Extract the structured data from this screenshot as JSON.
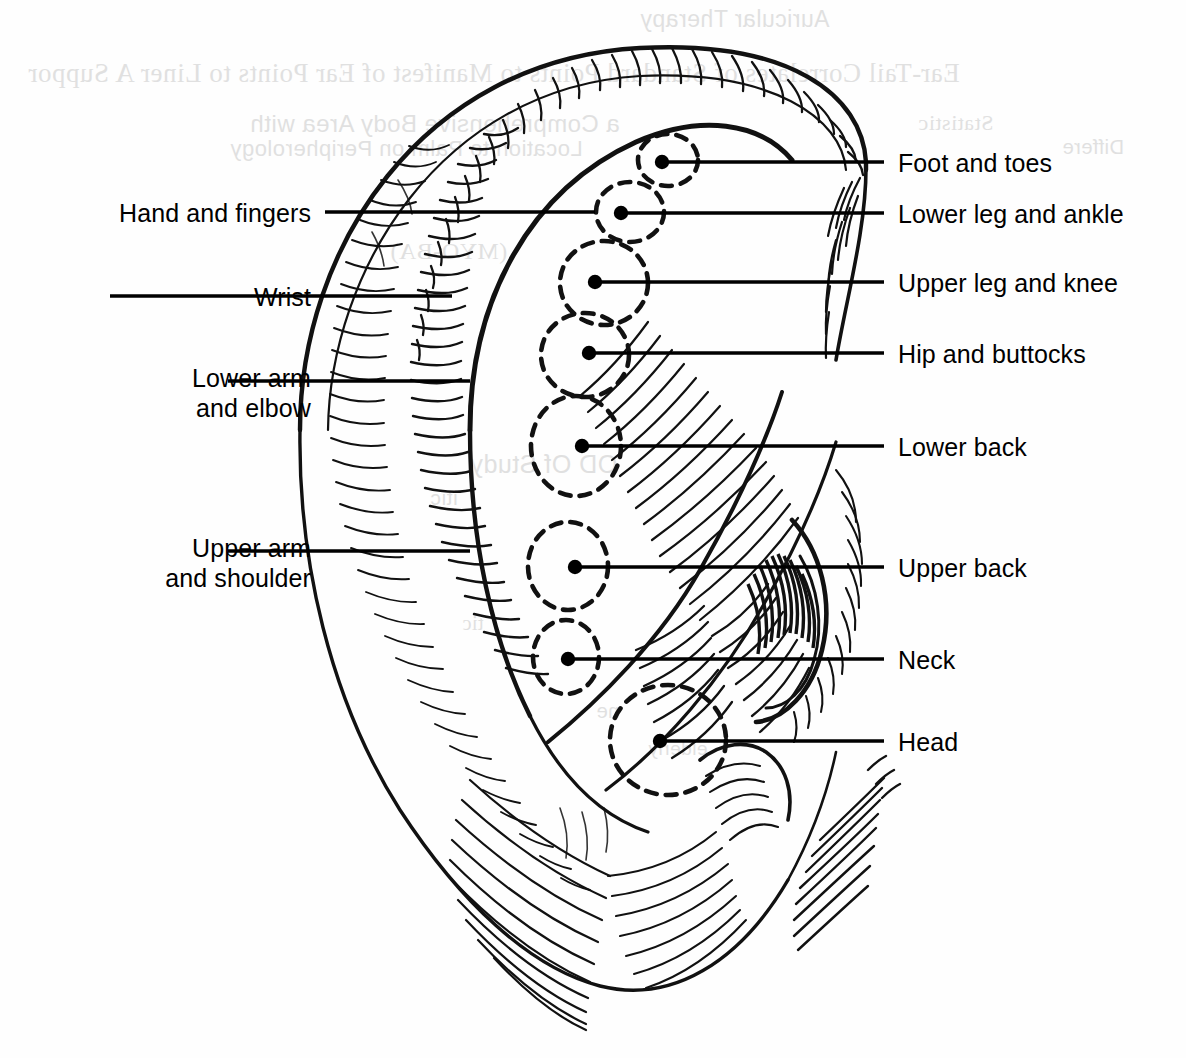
{
  "figure": {
    "kind": "auricular-body-map",
    "subject": "ear",
    "ink_color": "#000000",
    "background_color": "#ffffff"
  },
  "labels_left": [
    {
      "id": "hand-and-fingers",
      "text": "Hand and fingers",
      "x": 311,
      "y": 198,
      "leader": {
        "x1": 325,
        "y1": 212,
        "x2": 595,
        "y2": 212
      }
    },
    {
      "id": "wrist",
      "text": "Wrist",
      "x": 311,
      "y": 282,
      "leader": {
        "x1": 110,
        "y1": 296,
        "x2": 452,
        "y2": 296
      }
    },
    {
      "id": "lower-arm-elbow",
      "text": "Lower arm\nand elbow",
      "x": 311,
      "y": 363,
      "leader": {
        "x1": 228,
        "y1": 381,
        "x2": 470,
        "y2": 381
      }
    },
    {
      "id": "upper-arm-shoulder",
      "text": "Upper arm\nand shoulder",
      "x": 311,
      "y": 533,
      "leader": {
        "x1": 228,
        "y1": 551,
        "x2": 470,
        "y2": 551
      }
    }
  ],
  "labels_right": [
    {
      "id": "foot-and-toes",
      "text": "Foot and toes",
      "x": 898,
      "y": 148,
      "leader": {
        "x1": 662,
        "y1": 162,
        "x2": 884,
        "y2": 162
      },
      "dot": true
    },
    {
      "id": "lower-leg-and-ankle",
      "text": "Lower leg and ankle",
      "x": 898,
      "y": 199,
      "leader": {
        "x1": 621,
        "y1": 213,
        "x2": 884,
        "y2": 213
      },
      "dot": true
    },
    {
      "id": "upper-leg-and-knee",
      "text": "Upper leg and knee",
      "x": 898,
      "y": 268,
      "leader": {
        "x1": 595,
        "y1": 282,
        "x2": 884,
        "y2": 282
      },
      "dot": true
    },
    {
      "id": "hip-and-buttocks",
      "text": "Hip and buttocks",
      "x": 898,
      "y": 339,
      "leader": {
        "x1": 589,
        "y1": 353,
        "x2": 884,
        "y2": 353
      },
      "dot": true
    },
    {
      "id": "lower-back",
      "text": "Lower back",
      "x": 898,
      "y": 432,
      "leader": {
        "x1": 582,
        "y1": 446,
        "x2": 884,
        "y2": 446
      },
      "dot": true
    },
    {
      "id": "upper-back",
      "text": "Upper back",
      "x": 898,
      "y": 553,
      "leader": {
        "x1": 575,
        "y1": 567,
        "x2": 884,
        "y2": 567
      },
      "dot": true
    },
    {
      "id": "neck",
      "text": "Neck",
      "x": 898,
      "y": 645,
      "leader": {
        "x1": 568,
        "y1": 659,
        "x2": 884,
        "y2": 659
      },
      "dot": true
    },
    {
      "id": "head",
      "text": "Head",
      "x": 898,
      "y": 727,
      "leader": {
        "x1": 660,
        "y1": 741,
        "x2": 884,
        "y2": 741
      },
      "dot": true
    }
  ],
  "zone_circles": [
    {
      "id": "zone-foot-toes",
      "cx": 668,
      "cy": 160,
      "rx": 30,
      "ry": 26
    },
    {
      "id": "zone-lower-leg-ankle",
      "cx": 630,
      "cy": 212,
      "rx": 34,
      "ry": 30
    },
    {
      "id": "zone-upper-leg-knee",
      "cx": 604,
      "cy": 283,
      "rx": 44,
      "ry": 42
    },
    {
      "id": "zone-hip-buttocks",
      "cx": 585,
      "cy": 355,
      "rx": 44,
      "ry": 42
    },
    {
      "id": "zone-lower-back",
      "cx": 576,
      "cy": 446,
      "rx": 45,
      "ry": 50
    },
    {
      "id": "zone-upper-back",
      "cx": 568,
      "cy": 566,
      "rx": 40,
      "ry": 44
    },
    {
      "id": "zone-neck",
      "cx": 566,
      "cy": 657,
      "rx": 33,
      "ry": 37
    },
    {
      "id": "zone-head",
      "cx": 668,
      "cy": 740,
      "rx": 58,
      "ry": 55
    }
  ],
  "ghost_text": {
    "note": "faint show-through from the reverse of the printed page",
    "lines": [
      {
        "text": "Ear-Tail Correlates of Standard Points to Manifest of Ear Points to Liner A Suppor",
        "x": 28,
        "y": 58,
        "size": 27
      },
      {
        "text": "a Comprehensive Body Area with",
        "x": 250,
        "y": 110,
        "size": 24
      },
      {
        "text": "Location to Palm on Peripherology",
        "x": 230,
        "y": 136,
        "size": 22
      },
      {
        "text": "Statistic",
        "x": 918,
        "y": 110,
        "size": 22
      },
      {
        "text": "Differe",
        "x": 1062,
        "y": 136,
        "size": 20
      },
      {
        "text": "Auricular Therapy",
        "x": 640,
        "y": 6,
        "size": 23
      },
      {
        "text": "(MYO-BA)",
        "x": 390,
        "y": 238,
        "size": 24
      },
      {
        "text": "OD   Of Study",
        "x": 470,
        "y": 450,
        "size": 25
      },
      {
        "text": "itic",
        "x": 430,
        "y": 486,
        "size": 21
      },
      {
        "text": "tic",
        "x": 462,
        "y": 612,
        "size": 20
      },
      {
        "text": "ne",
        "x": 596,
        "y": 700,
        "size": 20
      },
      {
        "text": "elderly",
        "x": 648,
        "y": 738,
        "size": 19
      }
    ]
  }
}
